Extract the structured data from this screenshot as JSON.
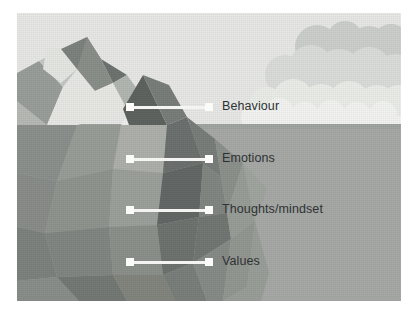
{
  "diagram": {
    "type": "iceberg-model",
    "waterline_y": 124,
    "labels": [
      {
        "text": "Behaviour",
        "zone": "above-water",
        "marker_x": 126,
        "marker_y": 104,
        "label_x": 222,
        "label_y": 99,
        "line_from": 134,
        "line_to": 208
      },
      {
        "text": "Emotions",
        "zone": "below-water",
        "marker_x": 126,
        "marker_y": 156,
        "label_x": 222,
        "label_y": 151,
        "line_from": 134,
        "line_to": 208
      },
      {
        "text": "Thoughts/mindset",
        "zone": "below-water",
        "marker_x": 126,
        "marker_y": 207,
        "label_x": 222,
        "label_y": 202,
        "line_from": 134,
        "line_to": 208
      },
      {
        "text": "Values",
        "zone": "below-water",
        "marker_x": 126,
        "marker_y": 259,
        "label_x": 222,
        "label_y": 254,
        "line_from": 134,
        "line_to": 208
      }
    ],
    "colors": {
      "sky": "#e9eae7",
      "cloud": "#dcdedb",
      "cloud_dark": "#c9ccc8",
      "water": "#a7aaa6",
      "ice_light": "#f2f3f0",
      "ice_mid": "#b9bcb7",
      "ice_dark": "#6f7471",
      "marker": "#fbfbfa",
      "connector": "#f4f4f2",
      "label_text": "#2f3234",
      "page_background": "#ffffff"
    }
  }
}
